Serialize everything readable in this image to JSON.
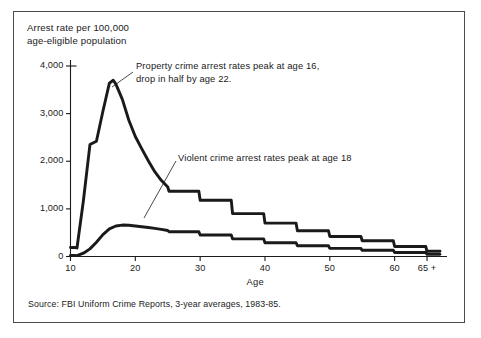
{
  "figure": {
    "border_color": "#4a4a52",
    "background": "#ffffff",
    "ink_color": "#1a1a1a"
  },
  "axis": {
    "y_title": "Arrest rate per 100,000\nage-eligible population",
    "x_title": "Age",
    "y_ticks": [
      "0",
      "1,000",
      "2,000",
      "3,000",
      "4,000"
    ],
    "x_ticks": [
      "10",
      "20",
      "30",
      "40",
      "50",
      "60",
      "65 +"
    ]
  },
  "annotations": [
    {
      "name": "property-crime-annotation",
      "text": "Property crime arrest rates peak at age 16,\ndrop in half by age 22.",
      "left": 136,
      "top": 60
    },
    {
      "name": "violent-crime-annotation",
      "text": "Violent crime arrest rates peak at age 18",
      "left": 178,
      "top": 152
    }
  ],
  "source": "Source: FBI Uniform Crime Reports, 3-year averages, 1983-85.",
  "chart_data": {
    "type": "line",
    "title": "",
    "xlabel": "Age",
    "ylabel": "Arrest rate per 100,000 age-eligible population",
    "xlim": [
      10,
      67
    ],
    "ylim": [
      0,
      4000
    ],
    "grid": false,
    "legend": "none",
    "y_tick_values": [
      0,
      1000,
      2000,
      3000,
      4000
    ],
    "x_tick_values": [
      10,
      20,
      30,
      40,
      50,
      60,
      65
    ],
    "series": [
      {
        "name": "Property crime arrest rate",
        "x": [
          10,
          10.6,
          11,
          12,
          13,
          14,
          15,
          16,
          16.6,
          17,
          18,
          19,
          20,
          21,
          22,
          23,
          24,
          25,
          25.2,
          29.8,
          30,
          34.8,
          35,
          39.8,
          40,
          44.8,
          45,
          49.8,
          50,
          54.8,
          55,
          59.8,
          60,
          64.8,
          65,
          67
        ],
        "y": [
          190,
          190,
          180,
          1180,
          2350,
          2420,
          3050,
          3640,
          3700,
          3620,
          3300,
          2860,
          2520,
          2260,
          2010,
          1780,
          1600,
          1460,
          1370,
          1370,
          1180,
          1180,
          900,
          900,
          700,
          700,
          540,
          540,
          420,
          420,
          330,
          330,
          210,
          210,
          110,
          110
        ]
      },
      {
        "name": "Violent crime arrest rate",
        "x": [
          10,
          10.6,
          11,
          12,
          13,
          14,
          15,
          16,
          17,
          18,
          19,
          20,
          21,
          22,
          23,
          24,
          25,
          25.2,
          29.8,
          30,
          34.8,
          35,
          39.8,
          40,
          44.8,
          45,
          49.8,
          50,
          54.8,
          55,
          59.8,
          60,
          64.8,
          65,
          67
        ],
        "y": [
          20,
          20,
          18,
          70,
          160,
          300,
          460,
          580,
          640,
          660,
          655,
          640,
          625,
          610,
          590,
          570,
          545,
          520,
          520,
          450,
          450,
          370,
          370,
          290,
          290,
          225,
          225,
          170,
          170,
          130,
          130,
          85,
          85,
          45,
          45
        ]
      }
    ],
    "leader_lines": [
      {
        "name": "property-leader",
        "from": [
          133,
          72
        ],
        "to": [
          112,
          87
        ]
      },
      {
        "name": "violent-leader",
        "from": [
          176,
          161
        ],
        "to": [
          144,
          218
        ]
      }
    ]
  }
}
